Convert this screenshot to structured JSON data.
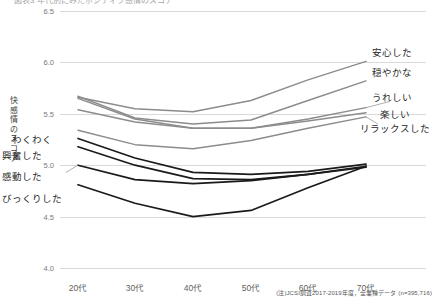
{
  "title_clipped": "図表3 年代別にみたポジティブ感情のスコア",
  "axis": {
    "y_title": "快感情のスコア",
    "y_ticks": [
      "6.5",
      "6.0",
      "5.5",
      "5.0",
      "4.5",
      "4.0"
    ],
    "x_ticks": [
      "20代",
      "30代",
      "40代",
      "50代",
      "60代",
      "70代"
    ]
  },
  "footnote": "(注)JCSI調査2017-2019年度，全業種データ (n=395,716)",
  "labels": {
    "right": [
      "安心した",
      "穏やかな",
      "うれしい",
      "楽しい",
      "リラックスした"
    ],
    "left": [
      "わくわく",
      "興奮した",
      "感動した",
      "びっくりした"
    ]
  },
  "colors": {
    "gray_series": "#8c8c8c",
    "dark_series": "#1a1a1a",
    "gridline": "#d9d9d9",
    "text": "#404040"
  },
  "chart_data": {
    "type": "line",
    "title": "図表3 年代別にみたポジティブ感情のスコア",
    "xlabel": "",
    "ylabel": "快感情のスコア",
    "categories": [
      "20代",
      "30代",
      "40代",
      "50代",
      "60代",
      "70代"
    ],
    "ylim": [
      4.0,
      6.5
    ],
    "yticks": [
      4.0,
      4.5,
      5.0,
      5.5,
      6.0,
      6.5
    ],
    "grid": true,
    "legend": "inline-end-labels",
    "series": [
      {
        "name": "安心した",
        "color": "#8c8c8c",
        "values": [
          5.66,
          5.55,
          5.52,
          5.63,
          5.83,
          6.01
        ]
      },
      {
        "name": "穏やかな",
        "color": "#8c8c8c",
        "values": [
          5.67,
          5.46,
          5.4,
          5.44,
          5.63,
          5.82
        ]
      },
      {
        "name": "うれしい",
        "color": "#8c8c8c",
        "values": [
          5.65,
          5.45,
          5.36,
          5.36,
          5.45,
          5.56
        ]
      },
      {
        "name": "楽しい",
        "color": "#8c8c8c",
        "values": [
          5.54,
          5.42,
          5.36,
          5.36,
          5.43,
          5.51
        ]
      },
      {
        "name": "リラックスした",
        "color": "#8c8c8c",
        "values": [
          5.34,
          5.2,
          5.16,
          5.24,
          5.36,
          5.47
        ]
      },
      {
        "name": "わくわく",
        "color": "#1a1a1a",
        "values": [
          5.26,
          5.07,
          4.93,
          4.91,
          4.94,
          5.01
        ]
      },
      {
        "name": "興奮した",
        "color": "#1a1a1a",
        "values": [
          5.18,
          5.0,
          4.87,
          4.86,
          4.91,
          4.99
        ]
      },
      {
        "name": "感動した",
        "color": "#1a1a1a",
        "values": [
          5.0,
          4.86,
          4.82,
          4.85,
          4.91,
          4.98
        ]
      },
      {
        "name": "びっくりした",
        "color": "#1a1a1a",
        "values": [
          4.81,
          4.63,
          4.5,
          4.56,
          4.78,
          4.99
        ]
      }
    ]
  }
}
